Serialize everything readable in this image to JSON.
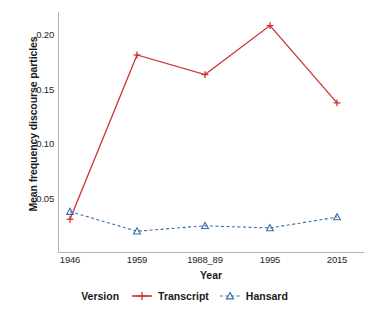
{
  "chart_data": {
    "type": "line",
    "title": "",
    "xlabel": "Year",
    "ylabel": "Mean frequency discourse particles",
    "categories": [
      "1946",
      "1959",
      "1988_89",
      "1995",
      "2015"
    ],
    "series": [
      {
        "name": "Transcript",
        "values": [
          0.031,
          0.182,
          0.164,
          0.209,
          0.138
        ],
        "color": "#cc3333",
        "marker": "plus",
        "linestyle": "solid"
      },
      {
        "name": "Hansard",
        "values": [
          0.038,
          0.02,
          0.025,
          0.023,
          0.033
        ],
        "color": "#3b6ea5",
        "marker": "triangle-open",
        "linestyle": "dashed"
      }
    ],
    "ylim": [
      0.0,
      0.2215
    ],
    "yticks": [
      0.05,
      0.1,
      0.15,
      0.2
    ],
    "ytick_labels": [
      "0.05",
      "0.10",
      "0.15",
      "0.20"
    ],
    "grid": false,
    "legend_position": "bottom"
  },
  "legend": {
    "title": "Version",
    "entries": [
      {
        "label": "Transcript",
        "color": "#cc3333",
        "marker": "plus",
        "linestyle": "solid"
      },
      {
        "label": "Hansard",
        "color": "#3b6ea5",
        "marker": "triangle-open",
        "linestyle": "dashed"
      }
    ]
  },
  "axes": {
    "x_title": "Year",
    "y_title": "Mean frequency discourse particles"
  }
}
